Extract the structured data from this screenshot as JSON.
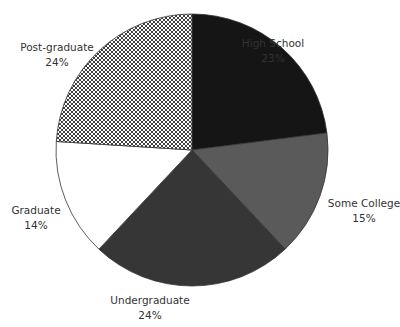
{
  "chart_data": {
    "type": "pie",
    "title": "",
    "start_angle_deg": 0,
    "direction": "clockwise",
    "center": [
      192,
      150
    ],
    "radius": 136,
    "slices": [
      {
        "label": "High School",
        "value": 23,
        "value_label": "23%",
        "fill": "#151515",
        "pattern": "solid",
        "label_pos": [
          273,
          36
        ]
      },
      {
        "label": "Some College",
        "value": 15,
        "value_label": "15%",
        "fill": "#5a5a5a",
        "pattern": "solid",
        "label_pos": [
          364,
          196
        ]
      },
      {
        "label": "Undergraduate",
        "value": 24,
        "value_label": "24%",
        "fill": "#363636",
        "pattern": "solid",
        "label_pos": [
          150,
          293
        ]
      },
      {
        "label": "Graduate",
        "value": 14,
        "value_label": "14%",
        "fill": "#ffffff",
        "pattern": "solid",
        "label_pos": [
          36,
          203
        ]
      },
      {
        "label": "Post-graduate",
        "value": 24,
        "value_label": "24%",
        "fill": "#ffffff",
        "pattern": "crosshatch",
        "label_pos": [
          57,
          40
        ]
      }
    ],
    "legend": "none",
    "outline_color": "#333333"
  }
}
